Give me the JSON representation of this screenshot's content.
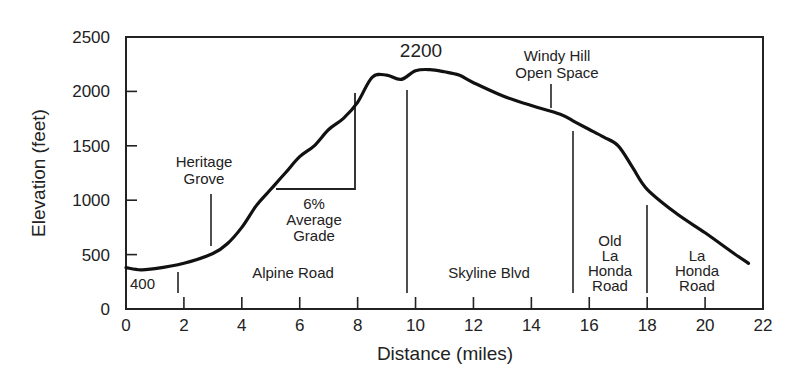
{
  "chart_data": {
    "type": "line",
    "title": "",
    "xlabel": "Distance  (miles)",
    "ylabel": "Elevation  (feet)",
    "xlim": [
      0,
      22
    ],
    "ylim": [
      0,
      2500
    ],
    "grid": false,
    "legend": null,
    "x_ticks": [
      0,
      2,
      4,
      6,
      8,
      10,
      12,
      14,
      16,
      18,
      20,
      22
    ],
    "y_ticks": [
      0,
      500,
      1000,
      1500,
      2000,
      2500
    ],
    "series": [
      {
        "name": "Elevation profile",
        "color": "#111111",
        "x": [
          0,
          0.5,
          1,
          2,
          3,
          3.5,
          4,
          4.5,
          5,
          5.5,
          6,
          6.5,
          7,
          7.5,
          8,
          8.5,
          9,
          9.5,
          10,
          10.5,
          11,
          11.5,
          12,
          13,
          14,
          15,
          15.5,
          16,
          16.5,
          17,
          17.5,
          18,
          19,
          20,
          21,
          21.5
        ],
        "y": [
          380,
          360,
          370,
          420,
          510,
          600,
          750,
          950,
          1100,
          1250,
          1400,
          1500,
          1650,
          1750,
          1900,
          2130,
          2150,
          2110,
          2190,
          2200,
          2180,
          2150,
          2080,
          1960,
          1870,
          1790,
          1720,
          1650,
          1580,
          1500,
          1300,
          1100,
          880,
          700,
          510,
          420
        ]
      }
    ],
    "annotations": [
      {
        "text": "400",
        "x": 0.2,
        "y": 230,
        "kind": "value-label"
      },
      {
        "text": "2200",
        "x": 10.2,
        "y": 2500,
        "kind": "value-label"
      },
      {
        "text": "Heritage Grove",
        "x": 2.9,
        "y": 1250,
        "kind": "landmark",
        "marker_x": 2.9
      },
      {
        "text": "Windy Hill Open Space",
        "x": 14.7,
        "y": 2150,
        "kind": "landmark",
        "marker_x": 14.7
      },
      {
        "text": "6% Average Grade",
        "kind": "grade-triangle",
        "x_range": [
          5.2,
          7.9
        ],
        "y_range": [
          1100,
          2000
        ]
      },
      {
        "text": "Alpine Road",
        "segment": [
          1.8,
          9.8
        ],
        "kind": "road-segment"
      },
      {
        "text": "Skyline Blvd",
        "segment": [
          9.8,
          15.5
        ],
        "kind": "road-segment"
      },
      {
        "text": "Old La Honda Road",
        "segment": [
          15.5,
          18.0
        ],
        "kind": "road-segment"
      },
      {
        "text": "La Honda Road",
        "segment": [
          18.0,
          21.5
        ],
        "kind": "road-segment"
      }
    ]
  },
  "labels": {
    "y_axis_title": "Elevation  (feet)",
    "x_axis_title": "Distance  (miles)",
    "start_elevation": "400",
    "peak_elevation": "2200",
    "heritage_grove": [
      "Heritage",
      "Grove"
    ],
    "windy_hill": [
      "Windy  Hill",
      "Open  Space"
    ],
    "grade": [
      "6%",
      "Average",
      "Grade"
    ],
    "alpine_road": "Alpine  Road",
    "skyline_blvd": "Skyline  Blvd",
    "old_la_honda": [
      "Old",
      "La",
      "Honda",
      "Road"
    ],
    "la_honda": [
      "La",
      "Honda",
      "Road"
    ]
  }
}
